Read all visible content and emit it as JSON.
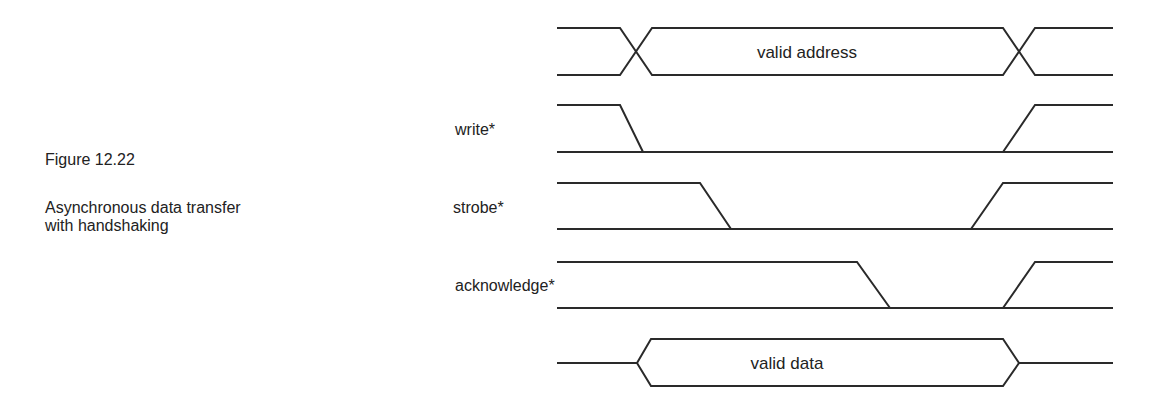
{
  "figure": {
    "number": "Figure 12.22",
    "caption_line1": "Asynchronous data transfer",
    "caption_line2": "with handshaking"
  },
  "signals": [
    {
      "name": "address",
      "label": "",
      "type": "bus",
      "bus_label": "valid address"
    },
    {
      "name": "write",
      "label": "write*",
      "type": "line"
    },
    {
      "name": "strobe",
      "label": "strobe*",
      "type": "line"
    },
    {
      "name": "acknowledge",
      "label": "acknowledge*",
      "type": "line"
    },
    {
      "name": "data",
      "label": "",
      "type": "bus",
      "bus_label": "valid data"
    }
  ],
  "colors": {
    "line": "#2a2a2a",
    "text": "#222222",
    "background": "#ffffff"
  }
}
